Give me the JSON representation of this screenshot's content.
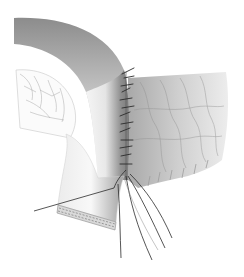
{
  "illustration": {
    "subject": "surgical anastomosis with interrupted sutures",
    "colors": {
      "background": "#ffffff",
      "tube_dark": "#7a7a7a",
      "tube_light": "#f2f2f2",
      "tissue_mid": "#b5b5b5",
      "tissue_light": "#e6e6e6",
      "suture": "#2b2b2b",
      "vessel_lines": "#9a9a9a"
    },
    "elements": [
      {
        "name": "curved-tube",
        "description": "bent tubular organ, shaded"
      },
      {
        "name": "mesentery",
        "description": "fan-shaped tissue with vessel lines on left"
      },
      {
        "name": "textured-tissue",
        "description": "wrinkled tissue block on right"
      },
      {
        "name": "suture-line",
        "description": "row of interrupted stitches"
      },
      {
        "name": "suture-threads",
        "description": "loose thread ends hanging down"
      },
      {
        "name": "cut-end",
        "description": "open tube end with staple row"
      }
    ]
  }
}
